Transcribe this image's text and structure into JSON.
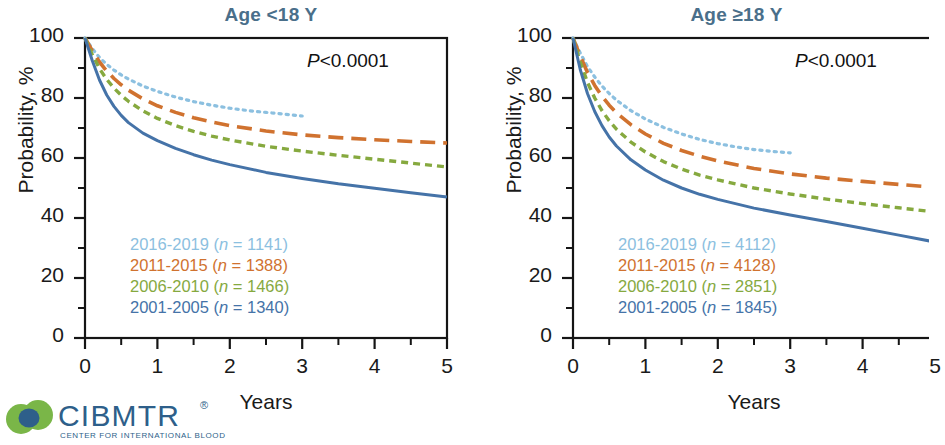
{
  "figure": {
    "axis_label_y": "Probability, %",
    "axis_label_x": "Years"
  },
  "logo": {
    "name": "CIBMTR",
    "registered_mark": "®",
    "tagline": "CENTER FOR INTERNATIONAL BLOOD"
  },
  "panels": [
    {
      "id": "age-under-18",
      "title": "Age <18 Y",
      "pvalue_prefix": "P",
      "pvalue_text": "<0.0001",
      "legend": [
        {
          "label": "2016-2019",
          "n_prefix": "(",
          "n_italic": "n",
          "n_text": " = 1141)",
          "color": "#8cc0e0"
        },
        {
          "label": "2011-2015",
          "n_prefix": "(",
          "n_italic": "n",
          "n_text": " = 1388)",
          "color": "#d0722f"
        },
        {
          "label": "2006-2010",
          "n_prefix": "(",
          "n_italic": "n",
          "n_text": " = 1466)",
          "color": "#86a93f"
        },
        {
          "label": "2001-2005",
          "n_prefix": "(",
          "n_italic": "n",
          "n_text": " = 1340)",
          "color": "#4573a8"
        }
      ],
      "xticks": [
        "0",
        "1",
        "2",
        "3",
        "4",
        "5"
      ],
      "yticks": [
        "100",
        "80",
        "60",
        "40",
        "20",
        "0"
      ]
    },
    {
      "id": "age-18-and-over",
      "title": "Age ≥18 Y",
      "pvalue_prefix": "P",
      "pvalue_text": "<0.0001",
      "legend": [
        {
          "label": "2016-2019",
          "n_prefix": "(",
          "n_italic": "n",
          "n_text": " = 4112)",
          "color": "#8cc0e0"
        },
        {
          "label": "2011-2015",
          "n_prefix": "(",
          "n_italic": "n",
          "n_text": " = 4128)",
          "color": "#d0722f"
        },
        {
          "label": "2006-2010",
          "n_prefix": "(",
          "n_italic": "n",
          "n_text": " = 2851)",
          "color": "#86a93f"
        },
        {
          "label": "2001-2005",
          "n_prefix": "(",
          "n_italic": "n",
          "n_text": " = 1845)",
          "color": "#4573a8"
        }
      ],
      "xticks": [
        "0",
        "1",
        "2",
        "3",
        "4",
        "5"
      ],
      "yticks": [
        "100",
        "80",
        "60",
        "40",
        "20",
        "0"
      ]
    }
  ],
  "chart_data": [
    {
      "type": "line",
      "title": "Age <18 Y",
      "xlabel": "Years",
      "ylabel": "Probability, %",
      "xlim": [
        0,
        5
      ],
      "ylim": [
        0,
        100
      ],
      "xticks": [
        0,
        1,
        2,
        3,
        4,
        5
      ],
      "yticks": [
        0,
        20,
        40,
        60,
        80,
        100
      ],
      "minor_xticks": [
        0.5,
        1.5,
        2.5,
        3.5,
        4.5
      ],
      "minor_yticks": [
        10,
        30,
        50,
        70,
        90
      ],
      "grid": false,
      "legend_position": "lower-left-inside",
      "annotations": [
        {
          "text": "P<0.0001",
          "position": "top-right-inside"
        }
      ],
      "series": [
        {
          "name": "2016-2019",
          "n": 1141,
          "color": "#8cc0e0",
          "dash": "dotted",
          "x": [
            0,
            0.1,
            0.2,
            0.3,
            0.4,
            0.5,
            0.6,
            0.8,
            1.0,
            1.25,
            1.5,
            1.75,
            2.0,
            2.25,
            2.5,
            2.75,
            3.0
          ],
          "y": [
            100,
            96.5,
            93.5,
            91.2,
            89.3,
            87.7,
            86.3,
            84.0,
            82.2,
            80.3,
            78.8,
            77.6,
            76.6,
            75.8,
            75.2,
            74.6,
            74.0
          ]
        },
        {
          "name": "2011-2015",
          "n": 1388,
          "color": "#d0722f",
          "dash": "long-dash",
          "x": [
            0,
            0.1,
            0.2,
            0.3,
            0.4,
            0.5,
            0.6,
            0.8,
            1.0,
            1.25,
            1.5,
            1.75,
            2.0,
            2.5,
            3.0,
            3.5,
            4.0,
            4.5,
            5.0
          ],
          "y": [
            100,
            95.8,
            92.0,
            89.0,
            86.5,
            84.4,
            82.6,
            79.7,
            77.4,
            75.2,
            73.4,
            72.0,
            70.8,
            69.0,
            67.7,
            66.8,
            66.1,
            65.5,
            65.0
          ]
        },
        {
          "name": "2006-2010",
          "n": 1466,
          "color": "#86a93f",
          "dash": "short-dash",
          "x": [
            0,
            0.1,
            0.2,
            0.3,
            0.4,
            0.5,
            0.6,
            0.8,
            1.0,
            1.25,
            1.5,
            1.75,
            2.0,
            2.5,
            3.0,
            3.5,
            4.0,
            4.5,
            5.0
          ],
          "y": [
            100,
            94.5,
            89.8,
            86.2,
            83.3,
            80.9,
            78.9,
            75.7,
            73.2,
            70.8,
            68.9,
            67.3,
            66.0,
            63.9,
            62.3,
            60.9,
            59.6,
            58.3,
            57.0
          ]
        },
        {
          "name": "2001-2005",
          "n": 1340,
          "color": "#4573a8",
          "dash": "solid",
          "x": [
            0,
            0.1,
            0.2,
            0.3,
            0.4,
            0.5,
            0.6,
            0.8,
            1.0,
            1.25,
            1.5,
            1.75,
            2.0,
            2.5,
            3.0,
            3.5,
            4.0,
            4.5,
            5.0
          ],
          "y": [
            100,
            92.5,
            86.0,
            81.0,
            77.2,
            74.2,
            71.8,
            68.3,
            65.8,
            63.2,
            61.1,
            59.3,
            57.8,
            55.2,
            53.2,
            51.4,
            49.9,
            48.4,
            47.0
          ]
        }
      ]
    },
    {
      "type": "line",
      "title": "Age ≥18 Y",
      "xlabel": "Years",
      "ylabel": "Probability, %",
      "xlim": [
        0,
        5
      ],
      "ylim": [
        0,
        100
      ],
      "xticks": [
        0,
        1,
        2,
        3,
        4,
        5
      ],
      "yticks": [
        0,
        20,
        40,
        60,
        80,
        100
      ],
      "minor_xticks": [
        0.5,
        1.5,
        2.5,
        3.5,
        4.5
      ],
      "minor_yticks": [
        10,
        30,
        50,
        70,
        90
      ],
      "grid": false,
      "legend_position": "lower-left-inside",
      "annotations": [
        {
          "text": "P<0.0001",
          "position": "top-right-inside"
        }
      ],
      "series": [
        {
          "name": "2016-2019",
          "n": 4112,
          "color": "#8cc0e0",
          "dash": "dotted",
          "x": [
            0,
            0.1,
            0.2,
            0.3,
            0.4,
            0.5,
            0.6,
            0.8,
            1.0,
            1.25,
            1.5,
            1.75,
            2.0,
            2.25,
            2.5,
            2.75,
            3.0
          ],
          "y": [
            100,
            95.0,
            90.5,
            87.0,
            84.0,
            81.5,
            79.3,
            75.8,
            73.0,
            70.2,
            68.0,
            66.2,
            64.8,
            63.7,
            62.8,
            62.2,
            61.7
          ]
        },
        {
          "name": "2011-2015",
          "n": 4128,
          "color": "#d0722f",
          "dash": "long-dash",
          "x": [
            0,
            0.1,
            0.2,
            0.3,
            0.4,
            0.5,
            0.6,
            0.8,
            1.0,
            1.25,
            1.5,
            1.75,
            2.0,
            2.5,
            3.0,
            3.5,
            4.0,
            4.5,
            5.0
          ],
          "y": [
            100,
            94.0,
            88.5,
            84.2,
            80.6,
            77.6,
            75.1,
            71.1,
            68.0,
            64.9,
            62.5,
            60.6,
            59.0,
            56.5,
            54.7,
            53.3,
            52.2,
            51.2,
            50.2
          ]
        },
        {
          "name": "2006-2010",
          "n": 2851,
          "color": "#86a93f",
          "dash": "short-dash",
          "x": [
            0,
            0.1,
            0.2,
            0.3,
            0.4,
            0.5,
            0.6,
            0.8,
            1.0,
            1.25,
            1.5,
            1.75,
            2.0,
            2.5,
            3.0,
            3.5,
            4.0,
            4.5,
            5.0
          ],
          "y": [
            100,
            92.0,
            85.2,
            80.0,
            75.8,
            72.4,
            69.6,
            65.3,
            62.0,
            58.8,
            56.3,
            54.3,
            52.7,
            50.0,
            48.0,
            46.3,
            44.8,
            43.4,
            42.0
          ]
        },
        {
          "name": "2001-2005",
          "n": 1845,
          "color": "#4573a8",
          "dash": "solid",
          "x": [
            0,
            0.1,
            0.2,
            0.3,
            0.4,
            0.5,
            0.6,
            0.8,
            1.0,
            1.25,
            1.5,
            1.75,
            2.0,
            2.5,
            3.0,
            3.5,
            4.0,
            4.5,
            5.0
          ],
          "y": [
            100,
            89.5,
            81.5,
            75.5,
            70.8,
            67.0,
            64.0,
            59.4,
            56.0,
            52.6,
            50.0,
            47.9,
            46.2,
            43.3,
            41.0,
            38.8,
            36.6,
            34.3,
            32.0
          ]
        }
      ]
    }
  ]
}
